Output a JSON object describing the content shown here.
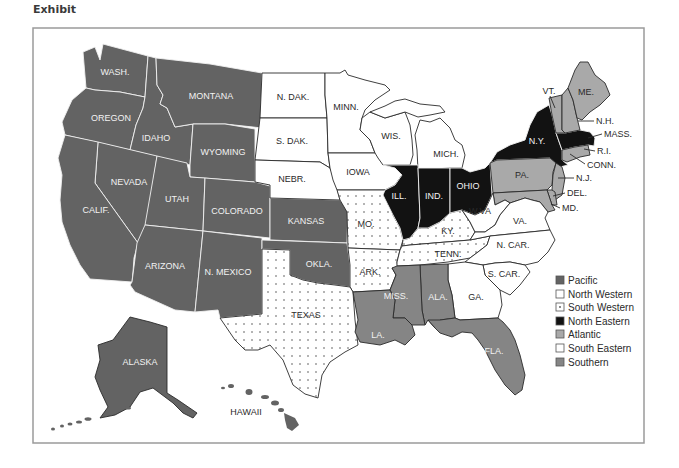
{
  "title": "Exhibit",
  "colors": {
    "pacific": "#636363",
    "north_western": "#ffffff",
    "south_western_bg": "#ffffff",
    "south_western_dot": "#555555",
    "north_eastern": "#121212",
    "atlantic": "#a9a9a9",
    "south_eastern": "#ffffff",
    "southern": "#858585",
    "frame": "#9a9a9a"
  },
  "legend": [
    {
      "label": "Pacific",
      "key": "pacific"
    },
    {
      "label": "North Western",
      "key": "north_western"
    },
    {
      "label": "South Western",
      "key": "south_western"
    },
    {
      "label": "North Eastern",
      "key": "north_eastern"
    },
    {
      "label": "Atlantic",
      "key": "atlantic"
    },
    {
      "label": "South Eastern",
      "key": "south_eastern"
    },
    {
      "label": "Southern",
      "key": "southern"
    }
  ],
  "states": {
    "wash": "WASH.",
    "oregon": "OREGON",
    "montana": "MONTANA",
    "idaho": "IDAHO",
    "wyoming": "WYOMING",
    "nevada": "NEVADA",
    "calif": "CALIF.",
    "utah": "UTAH",
    "colorado": "COLORADO",
    "arizona": "ARIZONA",
    "n_mexico": "N. MEXICO",
    "kansas": "KANSAS",
    "okla": "OKLA.",
    "alaska": "ALASKA",
    "hawaii": "HAWAII",
    "n_dak": "N. DAK.",
    "s_dak": "S. DAK.",
    "nebr": "NEBR.",
    "minn": "MINN.",
    "iowa": "IOWA",
    "wis": "WIS.",
    "mich": "MICH.",
    "mo": "MO.",
    "ark": "ARK.",
    "texas": "TEXAS",
    "ky": "KY.",
    "tenn": "TENN.",
    "ill": "ILL.",
    "ind": "IND.",
    "ohio": "OHIO",
    "ny": "N.Y.",
    "mass": "MASS.",
    "vt": "VT.",
    "me": "ME.",
    "nh": "N.H.",
    "ri": "R.I.",
    "conn": "CONN.",
    "pa": "PA.",
    "nj": "N.J.",
    "del": "DEL.",
    "md": "MD.",
    "wva": "W.VA",
    "va": "VA.",
    "n_car": "N. CAR.",
    "s_car": "S. CAR.",
    "ga": "GA.",
    "miss": "MISS.",
    "ala": "ALA.",
    "la": "LA.",
    "fla": "FLA."
  },
  "map_data": {
    "regions": [
      {
        "name": "Pacific",
        "states": [
          "WASH.",
          "OREGON",
          "CALIF.",
          "NEVADA",
          "IDAHO",
          "MONTANA",
          "WYOMING",
          "UTAH",
          "COLORADO",
          "ARIZONA",
          "N. MEXICO",
          "KANSAS",
          "OKLA.",
          "ALASKA",
          "HAWAII"
        ]
      },
      {
        "name": "North Western",
        "states": [
          "N. DAK.",
          "S. DAK.",
          "NEBR.",
          "MINN.",
          "IOWA",
          "WIS.",
          "MICH."
        ]
      },
      {
        "name": "South Western",
        "states": [
          "MO.",
          "ARK.",
          "TEXAS",
          "KY.",
          "TENN."
        ]
      },
      {
        "name": "North Eastern",
        "states": [
          "ILL.",
          "IND.",
          "OHIO",
          "N.Y.",
          "MASS."
        ]
      },
      {
        "name": "Atlantic",
        "states": [
          "VT.",
          "ME.",
          "N.H.",
          "R.I.",
          "CONN.",
          "PA.",
          "N.J.",
          "DEL.",
          "MD."
        ]
      },
      {
        "name": "South Eastern",
        "states": [
          "W.VA",
          "VA.",
          "N. CAR.",
          "S. CAR.",
          "GA."
        ]
      },
      {
        "name": "Southern",
        "states": [
          "MISS.",
          "ALA.",
          "LA.",
          "FLA."
        ]
      }
    ]
  }
}
